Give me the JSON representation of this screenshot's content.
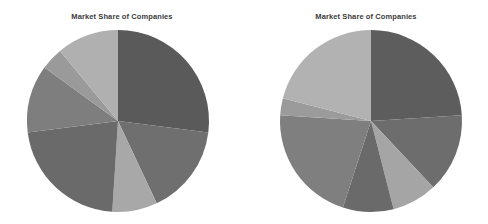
{
  "figure": {
    "background_color": "#ffffff",
    "width": 488,
    "height": 224,
    "panel_count": 2
  },
  "chart_data": [
    {
      "type": "pie",
      "title": "Market Share of Companies",
      "xlabel": "",
      "ylabel": "",
      "legend": "none",
      "grid": false,
      "start_angle_deg": 90,
      "direction": "clockwise",
      "center_px": [
        118,
        121
      ],
      "radius_px": 91,
      "categories": [
        "Company A",
        "Company B",
        "Company C",
        "Company D",
        "Company E",
        "Company F",
        "Company G"
      ],
      "values": [
        27,
        16,
        8,
        22,
        12,
        4,
        11
      ],
      "colors": [
        "#5a5a5a",
        "#6f6f6f",
        "#a8a8a8",
        "#6a6a6a",
        "#7e7e7e",
        "#9a9a9a",
        "#b0b0b0"
      ]
    },
    {
      "type": "pie",
      "title": "Market Share of Companies",
      "xlabel": "",
      "ylabel": "",
      "legend": "none",
      "grid": false,
      "start_angle_deg": 90,
      "direction": "clockwise",
      "center_px": [
        127,
        121
      ],
      "radius_px": 91,
      "categories": [
        "Company A",
        "Company B",
        "Company C",
        "Company D",
        "Company E",
        "Company F",
        "Company G"
      ],
      "values": [
        24,
        14,
        8,
        9,
        21,
        3,
        21
      ],
      "colors": [
        "#5d5d5d",
        "#6d6d6d",
        "#a5a5a5",
        "#6a6a6a",
        "#7f7f7f",
        "#9b9b9b",
        "#b2b2b2"
      ]
    }
  ],
  "panels": [
    {
      "name": "left-pie-panel",
      "title": "Market Share of Companies",
      "title_top_px": 12,
      "pie_left_px": 27,
      "pie_top_px": 30
    },
    {
      "name": "right-pie-panel",
      "title": "Market Share of Companies",
      "title_top_px": 12,
      "pie_left_px": 36,
      "pie_top_px": 30
    }
  ]
}
